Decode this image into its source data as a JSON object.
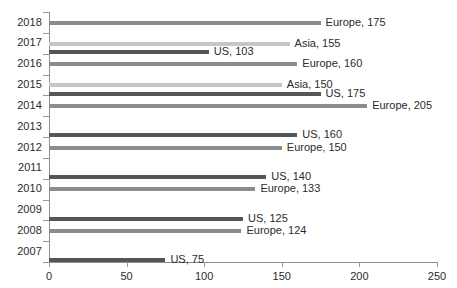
{
  "chart_data": {
    "type": "bar",
    "orientation": "horizontal",
    "title": "",
    "subtitle": "",
    "xlabel": "",
    "ylabel": "",
    "xlim": [
      0,
      250
    ],
    "xticks": [
      0,
      50,
      100,
      150,
      200,
      250
    ],
    "xtick_labels": [
      "0",
      "50",
      "100",
      "150",
      "200",
      "250"
    ],
    "categories": [
      "2018",
      "2017",
      "2016",
      "2015",
      "2014",
      "2013",
      "2012",
      "2011",
      "2010",
      "2009",
      "2008",
      "2007"
    ],
    "grid": false,
    "legend": "none",
    "series": [
      {
        "name": "Europe",
        "color": "#8c8c8c"
      },
      {
        "name": "Asia",
        "color": "#c6c6c6"
      },
      {
        "name": "US",
        "color": "#565656"
      }
    ],
    "bars": [
      {
        "year": "2018",
        "series": "Europe",
        "value": 175,
        "label": "Europe, 175",
        "slot": 0
      },
      {
        "year": "2017",
        "series": "Asia",
        "value": 155,
        "label": "Asia, 155",
        "slot": 0
      },
      {
        "year": "2017",
        "series": "US",
        "value": 103,
        "label": "US, 103",
        "slot": 1
      },
      {
        "year": "2016",
        "series": "Europe",
        "value": 160,
        "label": "Europe, 160",
        "slot": 0
      },
      {
        "year": "2015",
        "series": "Asia",
        "value": 150,
        "label": "Asia, 150",
        "slot": 0
      },
      {
        "year": "2015",
        "series": "US",
        "value": 175,
        "label": "US, 175",
        "slot": 1
      },
      {
        "year": "2014",
        "series": "Europe",
        "value": 205,
        "label": "Europe, 205",
        "slot": 0
      },
      {
        "year": "2013",
        "series": "US",
        "value": 160,
        "label": "US, 160",
        "slot": 1
      },
      {
        "year": "2012",
        "series": "Europe",
        "value": 150,
        "label": "Europe, 150",
        "slot": 0
      },
      {
        "year": "2011",
        "series": "US",
        "value": 140,
        "label": "US, 140",
        "slot": 1
      },
      {
        "year": "2010",
        "series": "Europe",
        "value": 133,
        "label": "Europe, 133",
        "slot": 0
      },
      {
        "year": "2009",
        "series": "US",
        "value": 125,
        "label": "US, 125",
        "slot": 1
      },
      {
        "year": "2008",
        "series": "Europe",
        "value": 124,
        "label": "Europe, 124",
        "slot": 0
      },
      {
        "year": "2007",
        "series": "US",
        "value": 75,
        "label": "US, 75",
        "slot": 1
      }
    ]
  }
}
